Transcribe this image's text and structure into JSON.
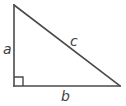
{
  "diagram": {
    "kind": "right-triangle",
    "stroke_color": "#4a4a4a",
    "label_color": "#3f3f3f",
    "background_color": "#ffffff",
    "stroke_width": 1.6,
    "vertices": {
      "top": [
        14,
        5
      ],
      "bottom_left": [
        14,
        86
      ],
      "bottom_right": [
        120,
        86
      ]
    },
    "right_angle_marker": {
      "corner": "bottom-left",
      "size": 9
    },
    "labels": {
      "leg_vertical": "a",
      "hypotenuse": "c",
      "leg_horizontal": "b"
    }
  }
}
